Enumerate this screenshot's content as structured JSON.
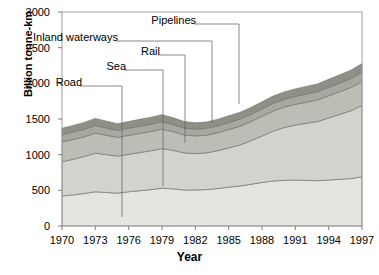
{
  "chart_data": {
    "type": "area",
    "title": "",
    "subtitle": "",
    "xlabel": "Year",
    "ylabel": "Billion tonne-km",
    "xlim": [
      1970,
      1997
    ],
    "ylim": [
      0,
      3000
    ],
    "grid": false,
    "legend_position": "inline-annotations",
    "stacked": true,
    "xticks": [
      "1970",
      "1973",
      "1976",
      "1979",
      "1982",
      "1985",
      "1988",
      "1991",
      "1994",
      "1997"
    ],
    "xtick_values": [
      1970,
      1973,
      1976,
      1979,
      1982,
      1985,
      1988,
      1991,
      1994,
      1997
    ],
    "yticks": [
      "0",
      "500",
      "1000",
      "1500",
      "2000",
      "2500",
      "3000"
    ],
    "ytick_values": [
      0,
      500,
      1000,
      1500,
      2000,
      2500,
      3000
    ],
    "x": [
      1970,
      1971,
      1972,
      1973,
      1974,
      1975,
      1976,
      1977,
      1978,
      1979,
      1980,
      1981,
      1982,
      1983,
      1984,
      1985,
      1986,
      1987,
      1988,
      1989,
      1990,
      1991,
      1992,
      1993,
      1994,
      1995,
      1996,
      1997
    ],
    "series": [
      {
        "name": "Road",
        "color": "#e4e4e0",
        "values": [
          420,
          435,
          455,
          480,
          470,
          460,
          480,
          495,
          510,
          530,
          520,
          505,
          505,
          510,
          525,
          545,
          560,
          585,
          610,
          630,
          640,
          645,
          640,
          635,
          645,
          655,
          665,
          690
        ]
      },
      {
        "name": "Sea",
        "color": "#d3d3cd",
        "values": [
          480,
          500,
          520,
          540,
          530,
          520,
          525,
          535,
          545,
          555,
          540,
          520,
          510,
          515,
          530,
          550,
          575,
          610,
          650,
          700,
          740,
          770,
          800,
          830,
          870,
          910,
          950,
          1000
        ]
      },
      {
        "name": "Rail",
        "color": "#bdbdb6",
        "values": [
          280,
          278,
          276,
          282,
          272,
          262,
          266,
          268,
          270,
          272,
          262,
          252,
          248,
          248,
          252,
          258,
          262,
          268,
          276,
          282,
          286,
          290,
          296,
          302,
          310,
          318,
          326,
          336
        ]
      },
      {
        "name": "Inland waterways",
        "color": "#a8a8a0",
        "values": [
          102,
          103,
          104,
          106,
          102,
          98,
          100,
          101,
          102,
          104,
          100,
          96,
          94,
          95,
          96,
          98,
          100,
          102,
          105,
          107,
          109,
          111,
          113,
          115,
          118,
          121,
          124,
          128
        ]
      },
      {
        "name": "Pipelines",
        "color": "#8f8f87",
        "values": [
          88,
          92,
          96,
          100,
          96,
          92,
          94,
          96,
          97,
          99,
          95,
          91,
          89,
          90,
          91,
          93,
          95,
          97,
          100,
          102,
          104,
          106,
          108,
          110,
          113,
          116,
          119,
          123
        ]
      }
    ],
    "annotations": [
      {
        "label": "Road",
        "label_x": 82,
        "label_y": 83,
        "anchor_x": 122,
        "anchor_y": 217,
        "elbow_x": 122,
        "elbow_y": 86
      },
      {
        "label": "Sea",
        "label_x": 126,
        "label_y": 67,
        "anchor_x": 163,
        "anchor_y": 186,
        "elbow_x": 163,
        "elbow_y": 70
      },
      {
        "label": "Rail",
        "label_x": 160,
        "label_y": 52,
        "anchor_x": 185,
        "anchor_y": 143,
        "elbow_x": 185,
        "elbow_y": 55
      },
      {
        "label": "Inland waterways",
        "label_x": 118,
        "label_y": 38,
        "anchor_x": 212,
        "anchor_y": 123,
        "elbow_x": 212,
        "elbow_y": 41
      },
      {
        "label": "Pipelines",
        "label_x": 196,
        "label_y": 21,
        "anchor_x": 239,
        "anchor_y": 104,
        "elbow_x": 239,
        "elbow_y": 24
      }
    ],
    "colors": {
      "axis": "#808080",
      "frame": "#a0a0a0",
      "text": "#000000",
      "band_outline": "#777770"
    }
  },
  "plot_geometry": {
    "left": 62,
    "right": 362,
    "top": 12,
    "bottom": 226
  }
}
